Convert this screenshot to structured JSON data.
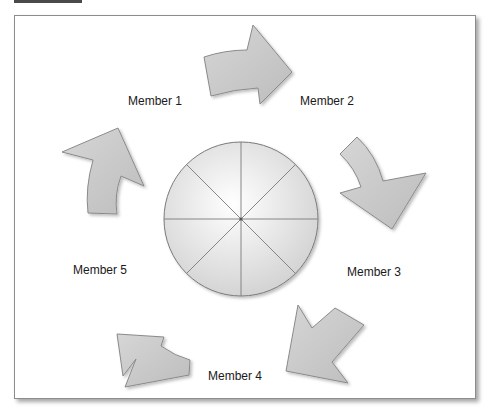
{
  "diagram": {
    "type": "cycle",
    "center": {
      "shape": "circle",
      "segments": 8
    },
    "members": [
      {
        "label": "Member 1"
      },
      {
        "label": "Member 2"
      },
      {
        "label": "Member 3"
      },
      {
        "label": "Member 4"
      },
      {
        "label": "Member 5"
      }
    ],
    "arrows": [
      {
        "from": "Member 1",
        "to": "Member 2",
        "direction": "right"
      },
      {
        "from": "Member 2",
        "to": "Member 3",
        "direction": "down-right"
      },
      {
        "from": "Member 3",
        "to": "Member 4",
        "direction": "down-left"
      },
      {
        "from": "Member 4",
        "to": "Member 5",
        "direction": "up-left"
      },
      {
        "from": "Member 5",
        "to": "Member 1",
        "direction": "up"
      }
    ],
    "colors": {
      "arrow_fill": "#c8c8c8",
      "arrow_stroke": "#8a8a8a",
      "circle_fill": "#e6e6e6",
      "circle_stroke": "#7a7a7a",
      "frame_border": "#8c8c8c",
      "top_bar": "#4a4a4a"
    }
  }
}
